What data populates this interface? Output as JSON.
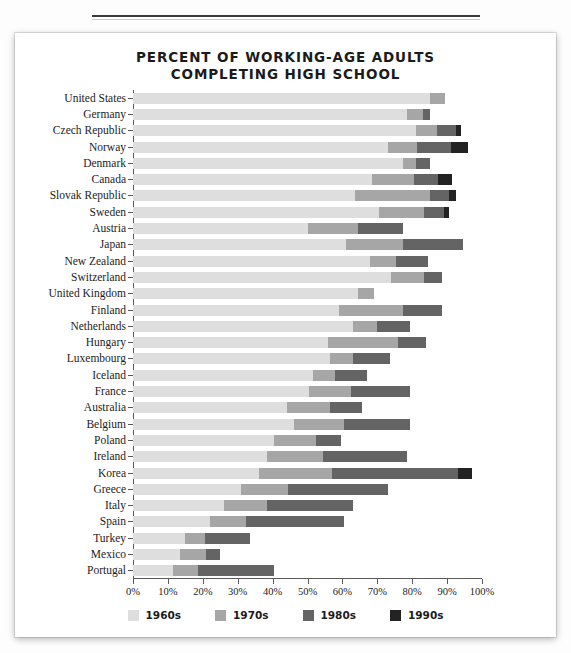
{
  "chart_data": {
    "type": "bar",
    "orientation": "horizontal",
    "stacked": true,
    "title": "PERCENT OF WORKING-AGE ADULTS COMPLETING HIGH SCHOOL",
    "title_line1": "PERCENT OF WORKING-AGE ADULTS",
    "title_line2": "COMPLETING HIGH SCHOOL",
    "xlabel": "",
    "ylabel": "",
    "xlim": [
      0,
      100
    ],
    "xticks": [
      0,
      10,
      20,
      30,
      40,
      50,
      60,
      70,
      80,
      90,
      100
    ],
    "xtick_labels": [
      "0%",
      "10%",
      "20%",
      "30%",
      "40%",
      "50%",
      "60%",
      "70%",
      "80%",
      "90%",
      "100%"
    ],
    "grid": false,
    "legend_position": "bottom",
    "series": [
      {
        "name": "1960s",
        "color": "#dedede"
      },
      {
        "name": "1970s",
        "color": "#a6a6a6"
      },
      {
        "name": "1980s",
        "color": "#646464"
      },
      {
        "name": "1990s",
        "color": "#232323"
      }
    ],
    "categories": [
      "United States",
      "Germany",
      "Czech Republic",
      "Norway",
      "Denmark",
      "Canada",
      "Slovak Republic",
      "Sweden",
      "Austria",
      "Japan",
      "New Zealand",
      "Switzerland",
      "United Kingdom",
      "Finland",
      "Netherlands",
      "Hungary",
      "Luxembourg",
      "Iceland",
      "France",
      "Australia",
      "Belgium",
      "Poland",
      "Ireland",
      "Korea",
      "Greece",
      "Italy",
      "Spain",
      "Turkey",
      "Mexico",
      "Portugal"
    ],
    "rows": [
      {
        "category": "United States",
        "values": [
          85.0,
          4.5,
          0.0,
          0.0
        ],
        "total": 89.5
      },
      {
        "category": "Germany",
        "values": [
          78.5,
          4.5,
          2.0,
          0.0
        ],
        "total": 85.0
      },
      {
        "category": "Czech Republic",
        "values": [
          81.0,
          6.0,
          5.5,
          1.5
        ],
        "total": 94.0
      },
      {
        "category": "Norway",
        "values": [
          73.0,
          8.5,
          9.5,
          5.0
        ],
        "total": 96.0
      },
      {
        "category": "Denmark",
        "values": [
          77.5,
          3.5,
          4.0,
          0.0
        ],
        "total": 85.0
      },
      {
        "category": "Canada",
        "values": [
          68.5,
          12.0,
          7.0,
          4.0
        ],
        "total": 91.5
      },
      {
        "category": "Slovak Republic",
        "values": [
          63.5,
          21.5,
          5.5,
          2.0
        ],
        "total": 92.5
      },
      {
        "category": "Sweden",
        "values": [
          70.5,
          13.0,
          5.5,
          1.5
        ],
        "total": 90.5
      },
      {
        "category": "Austria",
        "values": [
          50.0,
          14.5,
          13.0,
          0.0
        ],
        "total": 77.5
      },
      {
        "category": "Japan",
        "values": [
          61.0,
          16.5,
          17.0,
          0.0
        ],
        "total": 94.5
      },
      {
        "category": "New Zealand",
        "values": [
          68.0,
          7.5,
          9.0,
          0.0
        ],
        "total": 84.5
      },
      {
        "category": "Switzerland",
        "values": [
          74.0,
          9.5,
          5.0,
          0.0
        ],
        "total": 88.5
      },
      {
        "category": "United Kingdom",
        "values": [
          64.5,
          4.5,
          0.0,
          0.0
        ],
        "total": 69.0
      },
      {
        "category": "Finland",
        "values": [
          59.0,
          18.5,
          11.0,
          0.0
        ],
        "total": 88.5
      },
      {
        "category": "Netherlands",
        "values": [
          63.0,
          7.0,
          9.5,
          0.0
        ],
        "total": 79.5
      },
      {
        "category": "Hungary",
        "values": [
          56.0,
          20.0,
          8.0,
          0.0
        ],
        "total": 84.0
      },
      {
        "category": "Luxembourg",
        "values": [
          56.5,
          6.5,
          10.5,
          0.0
        ],
        "total": 73.5
      },
      {
        "category": "Iceland",
        "values": [
          51.5,
          6.5,
          9.0,
          0.0
        ],
        "total": 67.0
      },
      {
        "category": "France",
        "values": [
          50.5,
          12.0,
          17.0,
          0.0
        ],
        "total": 79.5
      },
      {
        "category": "Australia",
        "values": [
          44.0,
          12.5,
          9.0,
          0.0
        ],
        "total": 65.5
      },
      {
        "category": "Belgium",
        "values": [
          46.0,
          14.5,
          19.0,
          0.0
        ],
        "total": 79.5
      },
      {
        "category": "Poland",
        "values": [
          40.5,
          12.0,
          7.0,
          0.0
        ],
        "total": 59.5
      },
      {
        "category": "Ireland",
        "values": [
          38.5,
          16.0,
          24.0,
          0.0
        ],
        "total": 78.5
      },
      {
        "category": "Korea",
        "values": [
          36.0,
          21.0,
          36.0,
          4.0
        ],
        "total": 97.0
      },
      {
        "category": "Greece",
        "values": [
          31.0,
          13.5,
          28.5,
          0.0
        ],
        "total": 73.0
      },
      {
        "category": "Italy",
        "values": [
          26.0,
          12.5,
          24.5,
          0.0
        ],
        "total": 63.0
      },
      {
        "category": "Spain",
        "values": [
          22.0,
          10.5,
          28.0,
          0.0
        ],
        "total": 60.5
      },
      {
        "category": "Turkey",
        "values": [
          15.0,
          5.5,
          13.0,
          0.0
        ],
        "total": 33.5
      },
      {
        "category": "Mexico",
        "values": [
          13.5,
          7.5,
          4.0,
          0.0
        ],
        "total": 25.0
      },
      {
        "category": "Portugal",
        "values": [
          11.5,
          7.0,
          22.0,
          0.0
        ],
        "total": 40.5
      }
    ],
    "legend": [
      "1960s",
      "1970s",
      "1980s",
      "1990s"
    ]
  }
}
